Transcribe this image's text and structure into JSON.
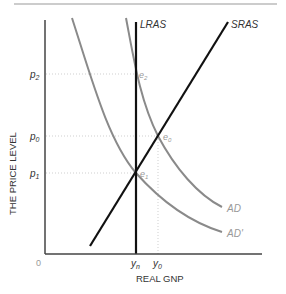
{
  "diagram": {
    "title": "",
    "y_axis_label": "THE PRICE LEVEL",
    "x_axis_label": "REAL GNP",
    "origin_label": "0",
    "y_ticks": [
      {
        "label": "p",
        "sub": "2",
        "name": "p2"
      },
      {
        "label": "p",
        "sub": "0",
        "name": "p0"
      },
      {
        "label": "p",
        "sub": "1",
        "name": "p1"
      }
    ],
    "x_ticks": [
      {
        "label": "y",
        "sub": "n",
        "name": "yn"
      },
      {
        "label": "y",
        "sub": "0",
        "name": "y0"
      }
    ],
    "curves": {
      "lras": "LRAS",
      "sras": "SRAS",
      "ad": "AD",
      "ad_prime": "AD'"
    },
    "points": [
      {
        "label": "e",
        "sub": "2",
        "name": "e2"
      },
      {
        "label": "e",
        "sub": "0",
        "name": "e0"
      },
      {
        "label": "e",
        "sub": "1",
        "name": "e1"
      }
    ],
    "colors": {
      "axes": "#333333",
      "lras": "#111111",
      "sras": "#111111",
      "ad": "#8a8a8a",
      "ad_prime": "#8a8a8a",
      "guides": "#cfcfcf"
    }
  }
}
